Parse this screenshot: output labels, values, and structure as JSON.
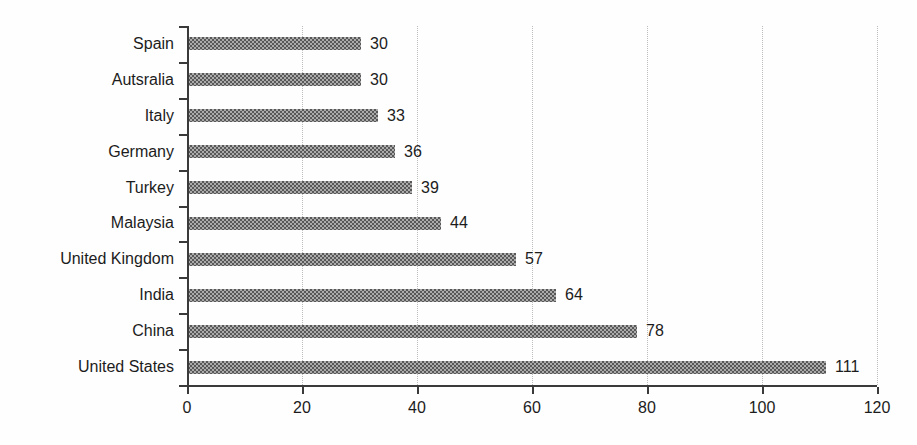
{
  "chart_data": {
    "type": "bar",
    "orientation": "horizontal",
    "title": "",
    "xlabel": "",
    "ylabel": "",
    "categories": [
      "Spain",
      "Autsralia",
      "Italy",
      "Germany",
      "Turkey",
      "Malaysia",
      "United Kingdom",
      "India",
      "China",
      "United States"
    ],
    "values": [
      30,
      30,
      33,
      36,
      39,
      44,
      57,
      64,
      78,
      111
    ],
    "value_labels": [
      "30",
      "30",
      "33",
      "36",
      "39",
      "44",
      "57",
      "64",
      "78",
      "111"
    ],
    "xlim": [
      0,
      120
    ],
    "xticks": [
      0,
      20,
      40,
      60,
      80,
      100,
      120
    ],
    "xtick_labels": [
      "0",
      "20",
      "40",
      "60",
      "80",
      "100",
      "120"
    ],
    "grid": "vertical-dotted",
    "gridlines_at": [
      20,
      40,
      60,
      80,
      100,
      120
    ],
    "legend": "none",
    "colors": {
      "bar_pattern_dark": "#585858",
      "bar_pattern_light": "#ababab",
      "axis": "#3a3a3a",
      "gridline": "#bdbdbd",
      "text": "#1c1c1c",
      "background": "#fefefe"
    }
  }
}
